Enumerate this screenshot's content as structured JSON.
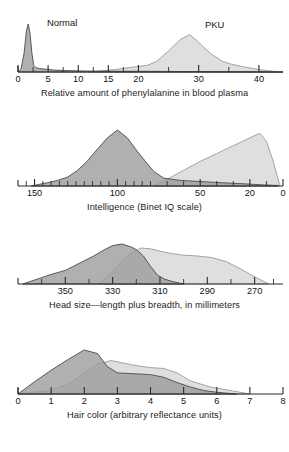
{
  "figure": {
    "title": "",
    "background_color": "#ffffff",
    "series_colors": {
      "normal_fill": "#9a9a9a",
      "normal_stroke": "#4a4a4a",
      "pku_fill": "#dcdcdc",
      "pku_stroke": "#9b9b9b",
      "axis": "#2a2a2a",
      "text": "#141414"
    }
  },
  "panels": [
    {
      "id": "phenylalanine",
      "caption": "Relative amount of phenylalanine in blood plasma",
      "curve_labels": [
        {
          "text": "Normal",
          "x_px": 47,
          "y_px": 3
        },
        {
          "text": "PKU",
          "x_px": 205,
          "y_px": 5
        }
      ],
      "axis": {
        "xlim": [
          0,
          44
        ],
        "reversed": false,
        "ticks": [
          0,
          2.5,
          5,
          7.5,
          10,
          12.5,
          15,
          17.5,
          20,
          25,
          30,
          35,
          40
        ],
        "tick_labels": [
          {
            "value": 0,
            "label": "0"
          },
          {
            "value": 5,
            "label": "5"
          },
          {
            "value": 10,
            "label": "10"
          },
          {
            "value": 15,
            "label": "15"
          },
          {
            "value": 20,
            "label": "20"
          },
          {
            "value": 30,
            "label": "30"
          },
          {
            "value": 40,
            "label": "40"
          }
        ]
      }
    },
    {
      "id": "intelligence",
      "caption": "Intelligence (Binet IQ scale)",
      "curve_labels": [],
      "axis": {
        "xlim": [
          160,
          0
        ],
        "reversed": true,
        "ticks": [
          155,
          150,
          145,
          140,
          135,
          130,
          125,
          120,
          115,
          110,
          105,
          100,
          95,
          90,
          85,
          80,
          70,
          60,
          50,
          40,
          30,
          20,
          10,
          0
        ],
        "tick_labels": [
          {
            "value": 150,
            "label": "150"
          },
          {
            "value": 100,
            "label": "100"
          },
          {
            "value": 50,
            "label": "50"
          },
          {
            "value": 20,
            "label": "20"
          },
          {
            "value": 0,
            "label": "0"
          }
        ]
      }
    },
    {
      "id": "headsize",
      "caption": "Head size—length plus breadth, in millimeters",
      "curve_labels": [],
      "axis": {
        "xlim": [
          370,
          258
        ],
        "reversed": true,
        "ticks": [
          360,
          350,
          340,
          330,
          320,
          310,
          300,
          290,
          280,
          270,
          262
        ],
        "tick_labels": [
          {
            "value": 350,
            "label": "350"
          },
          {
            "value": 330,
            "label": "330"
          },
          {
            "value": 310,
            "label": "310"
          },
          {
            "value": 290,
            "label": "290"
          },
          {
            "value": 270,
            "label": "270"
          }
        ]
      }
    },
    {
      "id": "haircolor",
      "caption": "Hair color (arbitrary reflectance units)",
      "curve_labels": [],
      "axis": {
        "xlim": [
          0,
          8
        ],
        "reversed": false,
        "ticks": [
          0,
          1,
          2,
          3,
          4,
          5,
          6,
          7,
          8
        ],
        "tick_labels": [
          {
            "value": 0,
            "label": "0"
          },
          {
            "value": 1,
            "label": "1"
          },
          {
            "value": 2,
            "label": "2"
          },
          {
            "value": 3,
            "label": "3"
          },
          {
            "value": 4,
            "label": "4"
          },
          {
            "value": 5,
            "label": "5"
          },
          {
            "value": 6,
            "label": "6"
          },
          {
            "value": 7,
            "label": "7"
          },
          {
            "value": 8,
            "label": "8"
          }
        ]
      }
    }
  ],
  "chart_data": [
    {
      "type": "area",
      "id": "phenylalanine",
      "title": "Relative amount of phenylalanine in blood plasma",
      "xlabel": "Relative amount of phenylalanine in blood plasma",
      "ylabel": "Frequency",
      "xlim": [
        0,
        44
      ],
      "grid": false,
      "legend": "inline-labels",
      "series": [
        {
          "name": "Normal",
          "fill": "#9a9a9a",
          "x": [
            0.0,
            0.5,
            1.0,
            1.4,
            1.7,
            2.0,
            2.3,
            2.6,
            3.0,
            3.6,
            4.5,
            6.0,
            8.0,
            11.0,
            44.0
          ],
          "values": [
            0,
            6,
            38,
            86,
            100,
            80,
            40,
            14,
            9,
            7,
            6,
            4,
            3,
            2,
            0
          ]
        },
        {
          "name": "PKU",
          "fill": "#dcdcdc",
          "x": [
            12.0,
            16.0,
            19.0,
            21.5,
            23.0,
            25.0,
            27.0,
            28.5,
            30.0,
            32.0,
            34.0,
            35.5,
            37.0,
            40.0,
            43.5
          ],
          "values": [
            0,
            5,
            10,
            14,
            22,
            44,
            68,
            78,
            62,
            38,
            22,
            16,
            12,
            5,
            0
          ]
        }
      ]
    },
    {
      "type": "area",
      "id": "intelligence",
      "title": "Intelligence (Binet IQ scale)",
      "xlabel": "Intelligence (Binet IQ scale)",
      "ylabel": "Frequency",
      "xlim": [
        160,
        0
      ],
      "grid": false,
      "legend": "none",
      "series": [
        {
          "name": "Normal",
          "fill": "#9a9a9a",
          "x": [
            152,
            147,
            142,
            136,
            130,
            124,
            118,
            112,
            106,
            100,
            94,
            88,
            82,
            78,
            72,
            62,
            50,
            38,
            24,
            12,
            3
          ],
          "values": [
            0,
            3,
            6,
            10,
            16,
            28,
            45,
            66,
            86,
            100,
            86,
            62,
            40,
            26,
            14,
            10,
            8,
            6,
            4,
            2,
            1
          ]
        },
        {
          "name": "PKU",
          "fill": "#dcdcdc",
          "x": [
            78,
            70,
            60,
            50,
            40,
            30,
            20,
            14,
            10,
            6,
            2
          ],
          "values": [
            0,
            12,
            28,
            44,
            58,
            72,
            86,
            94,
            80,
            45,
            2
          ]
        }
      ]
    },
    {
      "type": "area",
      "id": "headsize",
      "title": "Head size—length plus breadth, in millimeters",
      "xlabel": "Head size—length plus breadth, in millimeters",
      "ylabel": "Frequency",
      "xlim": [
        370,
        258
      ],
      "grid": false,
      "legend": "none",
      "series": [
        {
          "name": "Normal",
          "fill": "#9a9a9a",
          "x": [
            368,
            362,
            356,
            350,
            344,
            338,
            334,
            330,
            326,
            322,
            320,
            317,
            314,
            311,
            308,
            304,
            300
          ],
          "values": [
            0,
            12,
            24,
            34,
            52,
            70,
            84,
            96,
            100,
            92,
            86,
            70,
            44,
            22,
            12,
            5,
            0
          ]
        },
        {
          "name": "PKU",
          "fill": "#dcdcdc",
          "x": [
            336,
            330,
            326,
            322,
            318,
            314,
            310,
            305,
            300,
            294,
            288,
            282,
            276,
            270,
            264
          ],
          "values": [
            0,
            30,
            58,
            78,
            90,
            88,
            82,
            76,
            72,
            70,
            66,
            56,
            38,
            18,
            0
          ]
        }
      ]
    },
    {
      "type": "area",
      "id": "haircolor",
      "title": "Hair color (arbitrary reflectance units)",
      "xlabel": "Hair color (arbitrary reflectance units)",
      "ylabel": "Frequency",
      "xlim": [
        0,
        8
      ],
      "grid": false,
      "legend": "none",
      "series": [
        {
          "name": "Normal",
          "fill": "#9a9a9a",
          "x": [
            0.0,
            0.5,
            1.0,
            1.5,
            2.0,
            2.4,
            2.7,
            3.0,
            3.5,
            4.0,
            4.4,
            4.8,
            5.2,
            5.6,
            6.0,
            6.6
          ],
          "values": [
            0,
            28,
            54,
            78,
            100,
            92,
            62,
            48,
            46,
            44,
            38,
            26,
            16,
            8,
            4,
            0
          ]
        },
        {
          "name": "PKU",
          "fill": "#dcdcdc",
          "x": [
            0.0,
            0.6,
            1.0,
            1.6,
            2.0,
            2.4,
            2.8,
            3.2,
            3.6,
            4.0,
            4.4,
            4.8,
            5.2,
            5.8,
            6.4,
            7.0
          ],
          "values": [
            0,
            5,
            8,
            26,
            48,
            68,
            76,
            70,
            64,
            60,
            58,
            48,
            30,
            16,
            8,
            0
          ]
        }
      ]
    }
  ]
}
